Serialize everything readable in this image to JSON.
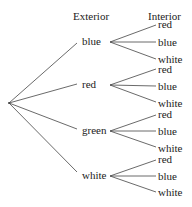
{
  "headers": {
    "exterior": "Exterior",
    "interior": "Interior"
  },
  "root": {
    "x": 9,
    "y": 103
  },
  "branches": [
    {
      "label": "blue",
      "y": 41,
      "children": [
        {
          "label": "red",
          "y": 24
        },
        {
          "label": "blue",
          "y": 41
        },
        {
          "label": "white",
          "y": 58
        }
      ]
    },
    {
      "label": "red",
      "y": 84,
      "children": [
        {
          "label": "red",
          "y": 68
        },
        {
          "label": "blue",
          "y": 85
        },
        {
          "label": "white",
          "y": 101
        }
      ]
    },
    {
      "label": "green",
      "y": 130,
      "children": [
        {
          "label": "red",
          "y": 114
        },
        {
          "label": "blue",
          "y": 130
        },
        {
          "label": "white",
          "y": 146
        }
      ]
    },
    {
      "label": "white",
      "y": 175,
      "children": [
        {
          "label": "red",
          "y": 159
        },
        {
          "label": "blue",
          "y": 175
        },
        {
          "label": "white",
          "y": 191
        }
      ]
    }
  ],
  "line_color": "#444444"
}
